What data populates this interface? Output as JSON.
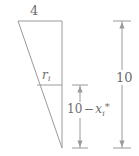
{
  "figure": {
    "type": "geometry-diagram",
    "background_color": "#ffffff",
    "line_color": "#9a9a9a",
    "text_color": "#6e6e6e",
    "labels": {
      "top_width": "4",
      "radius": "r",
      "radius_subscript": "i",
      "segment_number": "10",
      "segment_operator": "−",
      "segment_variable": "x",
      "segment_subscript": "i",
      "segment_star": "*",
      "total_height": "10"
    },
    "geometry": {
      "triangle_apex_top_left": [
        18,
        21
      ],
      "triangle_top_right": [
        62,
        21
      ],
      "triangle_bottom_vertex": [
        62,
        148
      ],
      "radius_line_y": 85,
      "radius_line_x_start": 37,
      "radius_line_x_end": 62,
      "segment_arrow_x": 80,
      "segment_arrow_top_y": 85,
      "segment_arrow_bottom_y": 148,
      "total_arrow_x": 122,
      "total_arrow_top_y": 21,
      "total_arrow_bottom_y": 148
    }
  }
}
